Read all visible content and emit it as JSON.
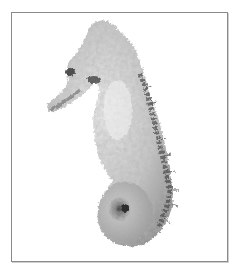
{
  "image": {
    "subject": "seahorse",
    "description": "Grayscale photograph of a dried seahorse facing left, with a knobbly body, long snout and coiled tail, on a white background inside a thin gray frame",
    "colors": {
      "background": "#ffffff",
      "frame": "#8a8a8a",
      "body_light": "#dcdcdc",
      "body_mid": "#a8a8a8",
      "body_dark": "#555555"
    }
  }
}
